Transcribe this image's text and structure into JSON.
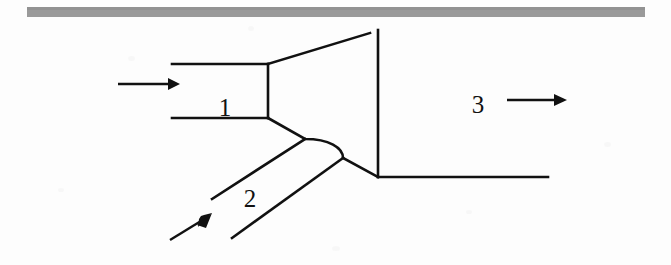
{
  "figure": {
    "type": "line-diagram",
    "background_color": "#fdfdfd",
    "line_color": "#111111",
    "rule_color": "#9a9a9a"
  },
  "top_rule": {
    "name": "horizontal-rule",
    "x1": 27,
    "x2": 645,
    "y": 12,
    "thickness": 10,
    "color": "#9a9a9a"
  },
  "labels": [
    {
      "id": "label-1",
      "text": "1",
      "x": 225,
      "y": 116,
      "channel": "inlet-primary"
    },
    {
      "id": "label-2",
      "text": "2",
      "x": 250,
      "y": 207,
      "channel": "inlet-secondary"
    },
    {
      "id": "label-3",
      "text": "3",
      "x": 478,
      "y": 113,
      "channel": "outlet"
    }
  ],
  "arrows": [
    {
      "id": "arrow-inlet-1",
      "label": "flow-arrow-channel-1",
      "direction": "right",
      "x1": 118,
      "y1": 84,
      "x2": 176,
      "y2": 84
    },
    {
      "id": "arrow-inlet-2",
      "label": "flow-arrow-channel-2",
      "direction": "up-right",
      "x1": 170,
      "y1": 240,
      "x2": 209,
      "y2": 216
    },
    {
      "id": "arrow-outlet-3",
      "label": "flow-arrow-channel-3",
      "direction": "right",
      "x1": 507,
      "y1": 100,
      "x2": 564,
      "y2": 100
    }
  ],
  "geometry": {
    "channel1_top_wall": "M 172 64 L 268 64",
    "channel1_bottom_wall": "M 172 118 L 268 118",
    "channel1_throat": "M 268 64 L 268 118",
    "diffuser_upper_wall": "M 268 64 L 370 33",
    "outlet_vertical_wall": "M 378 30 L 378 177",
    "outlet_bottom_wall": "M 378 177 L 548 177",
    "junction_upper_fillet": "M 268 118 L 305 139 C 330 139 343 147 343 158",
    "junction_lower_edge": "M 343 158 L 378 177",
    "channel2_upper_wall": "M 212 199 L 305 139",
    "channel2_lower_wall": "M 232 238 L 343 158"
  },
  "scan_artifacts": {
    "present": true,
    "note": "faint light-gray speckles from document scan"
  }
}
